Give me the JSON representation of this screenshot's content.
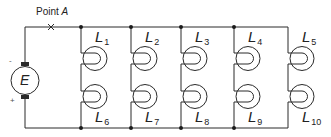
{
  "figure": {
    "point_label": "Point",
    "point_letter": "A",
    "source_label": "E",
    "minus_sign": "-",
    "plus_sign": "+",
    "colors": {
      "line": "#2a2a2a",
      "background": "#ffffff"
    }
  },
  "lamps": {
    "top": [
      {
        "name": "L",
        "sub": "1"
      },
      {
        "name": "L",
        "sub": "2"
      },
      {
        "name": "L",
        "sub": "3"
      },
      {
        "name": "L",
        "sub": "4"
      },
      {
        "name": "L",
        "sub": "5"
      }
    ],
    "bottom": [
      {
        "name": "L",
        "sub": "6"
      },
      {
        "name": "L",
        "sub": "7"
      },
      {
        "name": "L",
        "sub": "8"
      },
      {
        "name": "L",
        "sub": "9"
      },
      {
        "name": "L",
        "sub": "10"
      }
    ]
  }
}
